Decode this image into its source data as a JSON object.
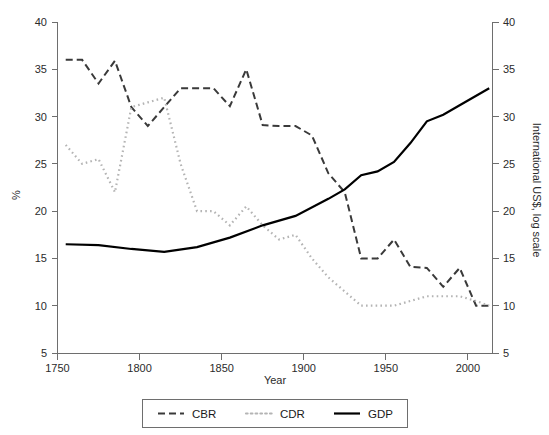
{
  "chart_data": {
    "type": "line",
    "title": "",
    "xlabel": "Year",
    "ylabel": "%",
    "y2label": "International US$, log scale",
    "xlim": [
      1750,
      2015
    ],
    "ylim": [
      5,
      40
    ],
    "y2lim": [
      5,
      40
    ],
    "grid": false,
    "legend_position": "bottom-center",
    "xticks": [
      1750,
      1800,
      1850,
      1900,
      1950,
      2000
    ],
    "xtick_labels": [
      "1750",
      "1800",
      "1850",
      "1900",
      "1950",
      "2000"
    ],
    "yticks": [
      5,
      10,
      15,
      20,
      25,
      30,
      35,
      40
    ],
    "ytick_labels": [
      "5",
      "10",
      "15",
      "20",
      "25",
      "30",
      "35",
      "40"
    ],
    "y2ticks": [
      5,
      10,
      15,
      20,
      25,
      30,
      35,
      40
    ],
    "y2tick_labels": [
      "5",
      "10",
      "15",
      "20",
      "25",
      "30",
      "35",
      "40"
    ],
    "series": [
      {
        "name": "CBR",
        "style": "dashed",
        "color": "#3a3a3a",
        "axis": "left",
        "x": [
          1755,
          1765,
          1775,
          1785,
          1795,
          1805,
          1815,
          1825,
          1835,
          1845,
          1855,
          1865,
          1875,
          1885,
          1895,
          1905,
          1915,
          1925,
          1935,
          1945,
          1955,
          1965,
          1975,
          1985,
          1995,
          2005,
          2013
        ],
        "values": [
          36.0,
          36.0,
          33.5,
          35.9,
          31.0,
          29.0,
          31.0,
          33.0,
          33.0,
          33.0,
          31.1,
          35.0,
          29.1,
          29.0,
          29.0,
          28.0,
          24.0,
          22.0,
          15.0,
          15.0,
          17.0,
          14.1,
          14.0,
          12.0,
          14.0,
          10.0,
          10.0
        ]
      },
      {
        "name": "CDR",
        "style": "dotted",
        "color": "#b4b4b4",
        "axis": "left",
        "x": [
          1755,
          1765,
          1775,
          1785,
          1795,
          1805,
          1815,
          1825,
          1835,
          1845,
          1855,
          1865,
          1875,
          1885,
          1895,
          1905,
          1915,
          1925,
          1935,
          1945,
          1955,
          1965,
          1975,
          1985,
          1995,
          2005,
          2013
        ],
        "values": [
          27.0,
          25.0,
          25.5,
          22.0,
          31.0,
          31.5,
          32.0,
          25.0,
          20.0,
          20.0,
          18.5,
          20.5,
          18.5,
          17.0,
          17.5,
          15.0,
          13.0,
          11.5,
          10.0,
          10.0,
          10.0,
          10.5,
          11.0,
          11.0,
          11.0,
          10.5,
          10.0
        ]
      },
      {
        "name": "GDP",
        "style": "solid",
        "color": "#000000",
        "axis": "right",
        "x": [
          1755,
          1775,
          1795,
          1815,
          1835,
          1855,
          1875,
          1895,
          1915,
          1925,
          1935,
          1945,
          1955,
          1965,
          1975,
          1985,
          1995,
          2013
        ],
        "values": [
          16.5,
          16.4,
          16.0,
          15.7,
          16.2,
          17.2,
          18.5,
          19.5,
          21.3,
          22.3,
          23.8,
          24.2,
          25.2,
          27.2,
          29.5,
          30.2,
          31.2,
          33.0
        ]
      }
    ]
  },
  "legend": {
    "items": [
      {
        "label": "CBR",
        "style": "dashed",
        "color": "#3a3a3a"
      },
      {
        "label": "CDR",
        "style": "dotted",
        "color": "#b4b4b4"
      },
      {
        "label": "GDP",
        "style": "solid",
        "color": "#000000"
      }
    ]
  },
  "axes": {
    "left_title": "%",
    "right_title": "International US$, log scale",
    "bottom_title": "Year"
  }
}
